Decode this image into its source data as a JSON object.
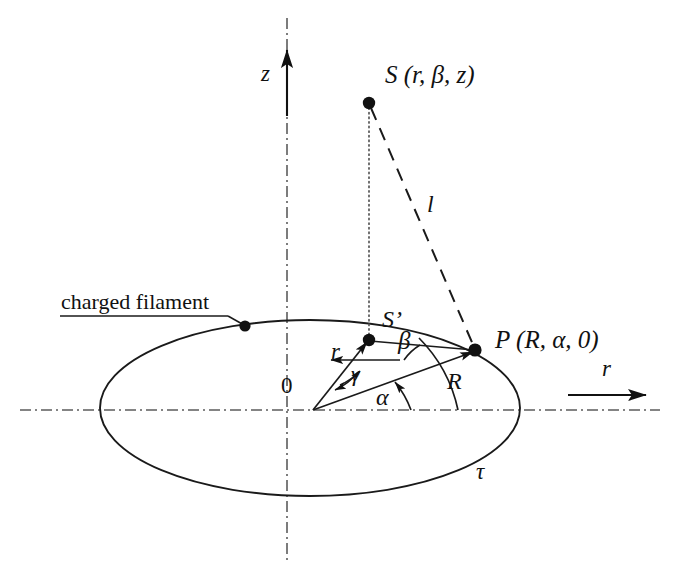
{
  "figure": {
    "background_color": "#ffffff",
    "line_color": "#1a1a1a",
    "axis_color": "#555555",
    "width": 674,
    "height": 581
  },
  "labels": {
    "z_axis": "z",
    "r_axis": "r",
    "source_point": "S (r, β, z)",
    "source_projection": "S’",
    "field_point": "P (R, α, 0)",
    "origin": "0",
    "distance_l": "l",
    "radius_r": "r",
    "radius_R": "R",
    "angle_alpha": "α",
    "angle_beta": "β",
    "angle_gamma": "γ",
    "ring_tau": "τ",
    "filament_callout": "charged filament"
  },
  "geometry": {
    "origin": {
      "x": 313,
      "y": 410
    },
    "ellipse": {
      "cx": 310,
      "cy": 408,
      "rx": 210,
      "ry": 88
    },
    "point_S": {
      "x": 369,
      "y": 103
    },
    "point_S_prime": {
      "x": 369,
      "y": 340
    },
    "point_P": {
      "x": 475,
      "y": 350
    },
    "point_filament_marker": {
      "x": 245,
      "y": 326
    },
    "z_axis_line": {
      "x": 287,
      "y_top": 18,
      "y_bottom": 562
    },
    "r_axis_line": {
      "y": 410,
      "x_left": 20,
      "x_right": 660
    },
    "z_arrow": {
      "x": 287,
      "y_tail": 113,
      "y_head": 48
    },
    "r_arrow": {
      "y": 395,
      "x_tail": 570,
      "x_head": 648
    }
  },
  "elements": [
    {
      "name": "dash-dot-vertical-axis",
      "style": "dash-dot"
    },
    {
      "name": "dash-dot-horizontal-axis",
      "style": "dash-dot"
    },
    {
      "name": "ellipse-ring",
      "style": "solid"
    },
    {
      "name": "dotted-drop-line-S-to-Sprime",
      "style": "dotted"
    },
    {
      "name": "dashed-line-S-to-P",
      "style": "dashed"
    },
    {
      "name": "vector-r-origin-to-Sprime",
      "style": "solid-arrow"
    },
    {
      "name": "vector-R-origin-to-P",
      "style": "solid-arrow"
    },
    {
      "name": "segment-Sprime-to-P",
      "style": "solid"
    },
    {
      "name": "arc-alpha",
      "style": "solid-arc"
    },
    {
      "name": "arc-beta",
      "style": "solid-arc"
    },
    {
      "name": "arc-gamma",
      "style": "solid-arc"
    },
    {
      "name": "callout-leader-charged-filament",
      "style": "solid"
    }
  ]
}
